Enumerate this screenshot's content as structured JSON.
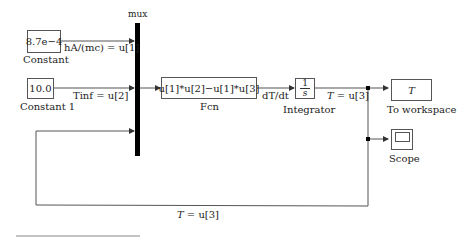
{
  "blocks": {
    "constant": {
      "value": "8.7e−4",
      "name": "Constant"
    },
    "constant1": {
      "value": "10.0",
      "name": "Constant 1"
    },
    "mux": {
      "name": "mux"
    },
    "fcn": {
      "expr": "u[1]*u[2]−u[1]*u[3]",
      "name": "Fcn"
    },
    "integrator": {
      "num": "1",
      "den": "s",
      "name": "Integrator"
    },
    "to_workspace": {
      "var": "T",
      "name": "To workspace"
    },
    "scope": {
      "name": "Scope",
      "icon": "scope-icon"
    }
  },
  "signals": {
    "u1": "hA/(mc) = u[1]",
    "u2": "Tinf = u[2]",
    "dTdt": "dT/dt",
    "out_T_var": "T",
    "out_T_rest": " = u[3]",
    "fb_T_var": "T",
    "fb_T_rest": " = u[3]"
  },
  "colors": {
    "wire": "#555555",
    "mux": "#000000"
  }
}
